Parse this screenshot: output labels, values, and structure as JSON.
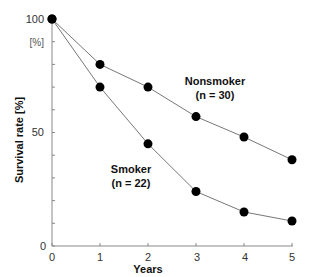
{
  "chart_data": {
    "type": "line",
    "title": "",
    "xlabel": "Years",
    "ylabel": "Survival rate [%]",
    "y_unit_label": "[%]",
    "x": [
      0,
      1,
      2,
      3,
      4,
      5
    ],
    "x_ticks": [
      "0",
      "1",
      "2",
      "3",
      "4",
      "5"
    ],
    "y_ticks_labeled": [
      "0",
      "50",
      "100"
    ],
    "y_minor_tick_step": 10,
    "xlim": [
      0,
      5
    ],
    "ylim": [
      0,
      100
    ],
    "grid": false,
    "legend_position": "inline annotations",
    "series": [
      {
        "name": "Nonsmoker",
        "label_line1": "Nonsmoker",
        "label_line2": "(n = 30)",
        "n": 30,
        "values": [
          100,
          80,
          70,
          57,
          48,
          38
        ]
      },
      {
        "name": "Smoker",
        "label_line1": "Smoker",
        "label_line2": "(n = 22)",
        "n": 22,
        "values": [
          100,
          70,
          45,
          24,
          15,
          11
        ]
      }
    ],
    "colors": {
      "line": "#777777",
      "marker": "#000000",
      "axis": "#888888"
    }
  }
}
